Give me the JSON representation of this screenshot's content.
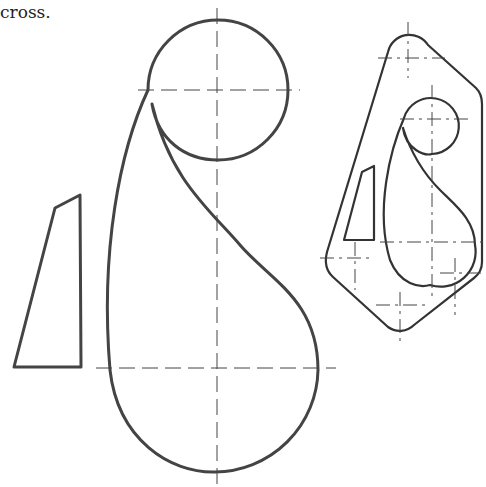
{
  "caption": "cross.",
  "figures": [
    {
      "name": "paisley-curve",
      "description": "Paisley-shaped curve built from two tangent arcs with centerlines"
    },
    {
      "name": "trapezoid",
      "description": "Quadrilateral shape to the left"
    },
    {
      "name": "template-outline",
      "description": "Scaled assembled view inside a rounded polygon outline"
    }
  ],
  "colors": {
    "line": "#444444",
    "background": "#ffffff"
  }
}
